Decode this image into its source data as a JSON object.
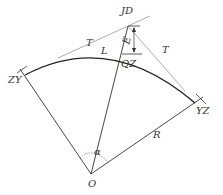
{
  "diagram": {
    "type": "circular curve geometry",
    "labels": {
      "jd": "JD",
      "qz": "QZ",
      "zy": "ZY",
      "yz": "YZ",
      "o": "O",
      "t_left": "T",
      "t_right": "T",
      "l": "L",
      "r": "R",
      "alpha": "α",
      "e": "E"
    },
    "colors": {
      "line": "#333333",
      "tangent": "#888888",
      "background": "#ffffff"
    }
  }
}
